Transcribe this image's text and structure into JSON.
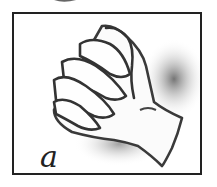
{
  "figure": {
    "caption": "a",
    "colors": {
      "frame": "#222222",
      "outline": "#333333",
      "shadow": "#7a7a7a",
      "background": "#ffffff"
    }
  }
}
